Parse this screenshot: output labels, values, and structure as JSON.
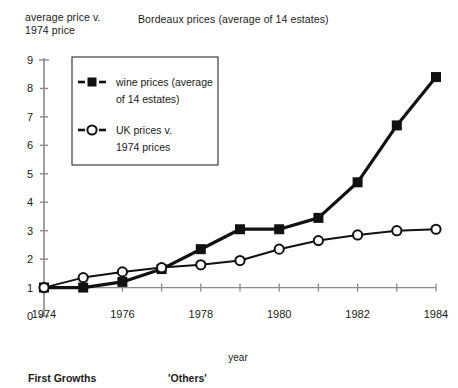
{
  "figure": {
    "title": "Bordeaux prices (average of 14 estates)",
    "y_axis_caption": "average price v.\n1974 price",
    "x_axis_title": "year",
    "caption_left": "First Growths",
    "caption_right": "'Others'"
  },
  "legend": {
    "entries": [
      {
        "marker": "filled-square",
        "label_line1": "wine prices (average",
        "label_line2": "of 14 estates)"
      },
      {
        "marker": "open-circle",
        "label_line1": "UK prices v.",
        "label_line2": "1974 prices"
      }
    ]
  },
  "colors": {
    "ink": "#1a1a1a",
    "axis": "#8a8a8a",
    "series": "#111111",
    "background": "#ffffff"
  },
  "chart_data": {
    "type": "line",
    "title": "Bordeaux prices (average of 14 estates)",
    "xlabel": "year",
    "ylabel": "average price v. 1974 price",
    "x": [
      1974,
      1975,
      1976,
      1977,
      1978,
      1979,
      1980,
      1981,
      1982,
      1983,
      1984
    ],
    "xlim": [
      1974,
      1984
    ],
    "ylim": [
      0,
      9
    ],
    "x_tick_values": [
      1974,
      1975,
      1976,
      1977,
      1978,
      1979,
      1980,
      1981,
      1982,
      1983,
      1984
    ],
    "x_tick_labels": [
      "1974",
      "",
      "1976",
      "",
      "1978",
      "",
      "1980",
      "",
      "1982",
      "",
      "1984"
    ],
    "y_ticks": [
      0,
      1,
      2,
      3,
      4,
      5,
      6,
      7,
      8,
      9
    ],
    "y_tick_labels": [
      "0",
      "1",
      "2",
      "3",
      "4",
      "5",
      "6",
      "7",
      "8",
      "9"
    ],
    "grid": false,
    "legend_position": "upper-left-inset",
    "series": [
      {
        "name": "wine prices (average of 14 estates)",
        "marker": "filled-square",
        "values": [
          1.0,
          1.0,
          1.2,
          1.65,
          2.35,
          3.05,
          3.05,
          3.45,
          4.7,
          6.7,
          8.4
        ]
      },
      {
        "name": "UK prices v. 1974 prices",
        "marker": "open-circle",
        "values": [
          1.0,
          1.35,
          1.55,
          1.7,
          1.8,
          1.95,
          2.35,
          2.65,
          2.85,
          3.0,
          3.05
        ]
      }
    ]
  }
}
